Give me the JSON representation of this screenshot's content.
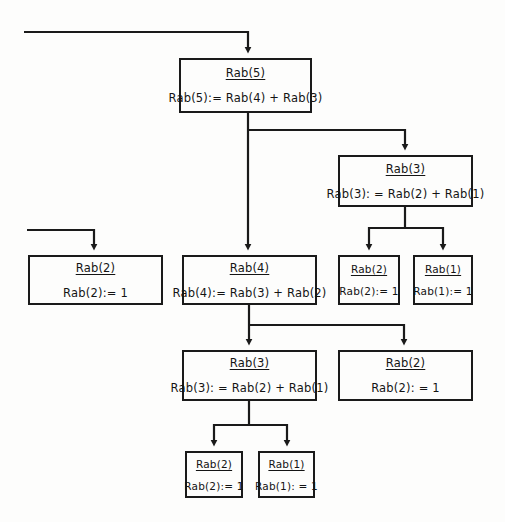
{
  "diagram": {
    "type": "recursion-tree",
    "colors": {
      "background": "#fdfdfc",
      "stroke": "#1a1a1a",
      "text": "#141414"
    },
    "nodes": [
      {
        "id": "rab5",
        "header": "Rab(5)",
        "body": "Rab(5):= Rab(4) + Rab(3)",
        "size": "large",
        "x": 179,
        "y": 58,
        "w": 133,
        "h": 55
      },
      {
        "id": "rab3-right",
        "header": "Rab(3)",
        "body": "Rab(3): = Rab(2) + Rab(1)",
        "size": "large",
        "x": 338,
        "y": 155,
        "w": 135,
        "h": 52
      },
      {
        "id": "rab2-left",
        "header": "Rab(2)",
        "body": "Rab(2):= 1",
        "size": "large",
        "x": 28,
        "y": 255,
        "w": 135,
        "h": 50
      },
      {
        "id": "rab4",
        "header": "Rab(4)",
        "body": "Rab(4):= Rab(3) + Rab(2)",
        "size": "large",
        "x": 182,
        "y": 255,
        "w": 135,
        "h": 50
      },
      {
        "id": "rab2-leaf-a",
        "header": "Rab(2)",
        "body": "Rab(2):= 1",
        "size": "small",
        "x": 338,
        "y": 255,
        "w": 62,
        "h": 50
      },
      {
        "id": "rab1-leaf-a",
        "header": "Rab(1)",
        "body": "Rab(1):= 1",
        "size": "small",
        "x": 413,
        "y": 255,
        "w": 60,
        "h": 50
      },
      {
        "id": "rab3-lower",
        "header": "Rab(3)",
        "body": "Rab(3): = Rab(2) + Rab(1)",
        "size": "large",
        "x": 182,
        "y": 350,
        "w": 135,
        "h": 51
      },
      {
        "id": "rab2-mid-right",
        "header": "Rab(2)",
        "body": "Rab(2): = 1",
        "size": "large",
        "x": 338,
        "y": 350,
        "w": 135,
        "h": 51
      },
      {
        "id": "rab2-leaf-b",
        "header": "Rab(2)",
        "body": "Rab(2):= 1",
        "size": "small",
        "x": 185,
        "y": 451,
        "w": 58,
        "h": 47
      },
      {
        "id": "rab1-leaf-b",
        "header": "Rab(1)",
        "body": "Rab(1): = 1",
        "size": "small",
        "x": 258,
        "y": 451,
        "w": 57,
        "h": 47
      }
    ],
    "connectors": [
      {
        "id": "entry-to-rab5",
        "from": "external-left",
        "to": "rab5",
        "arrow": true
      },
      {
        "id": "rab5-to-rab3-right",
        "from": "rab5",
        "to": "rab3-right",
        "arrow": true
      },
      {
        "id": "rab5-to-rab4",
        "from": "rab5",
        "to": "rab4",
        "arrow": true
      },
      {
        "id": "rab3right-to-rab2-leaf-a",
        "from": "rab3-right",
        "to": "rab2-leaf-a",
        "arrow": true
      },
      {
        "id": "rab3right-to-rab1-leaf-a",
        "from": "rab3-right",
        "to": "rab1-leaf-a",
        "arrow": true
      },
      {
        "id": "entry-to-rab2-left",
        "from": "external-left",
        "to": "rab2-left",
        "arrow": true
      },
      {
        "id": "rab4-to-rab3-lower",
        "from": "rab4",
        "to": "rab3-lower",
        "arrow": true
      },
      {
        "id": "rab4-to-rab2-mid-right",
        "from": "rab4",
        "to": "rab2-mid-right",
        "arrow": true
      },
      {
        "id": "rab3lower-to-rab2-leaf-b",
        "from": "rab3-lower",
        "to": "rab2-leaf-b",
        "arrow": true
      },
      {
        "id": "rab3lower-to-rab1-leaf-b",
        "from": "rab3-lower",
        "to": "rab1-leaf-b",
        "arrow": true
      }
    ]
  }
}
